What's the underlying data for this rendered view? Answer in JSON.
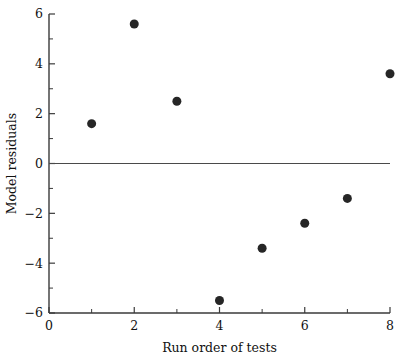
{
  "chart_data": {
    "type": "scatter",
    "title": "",
    "subtitle": "",
    "xlabel": "Run order of tests",
    "ylabel": "Model residuals",
    "xlim": [
      0,
      8
    ],
    "ylim": [
      -6,
      6
    ],
    "grid": false,
    "legend": null,
    "x": [
      1,
      2,
      3,
      4,
      5,
      6,
      7,
      8
    ],
    "values": [
      1.6,
      5.6,
      2.5,
      -5.5,
      -3.4,
      -2.4,
      -1.4,
      3.6
    ],
    "points": [
      {
        "x": 1,
        "y": 1.6
      },
      {
        "x": 2,
        "y": 5.6
      },
      {
        "x": 3,
        "y": 2.5
      },
      {
        "x": 4,
        "y": -5.5
      },
      {
        "x": 5,
        "y": -3.4
      },
      {
        "x": 6,
        "y": -2.4
      },
      {
        "x": 7,
        "y": -1.4
      },
      {
        "x": 8,
        "y": 3.6
      }
    ],
    "xticks": [
      0,
      2,
      4,
      6,
      8
    ],
    "xtick_labels": [
      "0",
      "2",
      "4",
      "6",
      "8"
    ],
    "x_minor_ticks": [
      1,
      3,
      5,
      7
    ],
    "yticks": [
      6,
      4,
      2,
      0,
      -2,
      -4,
      -6
    ],
    "ytick_labels": [
      "6",
      "4",
      "2",
      "0",
      "−2",
      "−4",
      "−6"
    ],
    "y_minor_ticks": [
      5,
      3,
      1,
      -1,
      -3,
      -5
    ],
    "reference_lines": [
      {
        "name": "zero-line",
        "orientation": "horizontal",
        "value": 0
      }
    ],
    "marker": {
      "shape": "circle",
      "color": "#262626",
      "size_px": 9
    },
    "colors": {
      "axis": "#3a3a3a",
      "reference_line": "#4a4a4a",
      "marker": "#262626",
      "background": "#ffffff",
      "text": "#111111"
    }
  },
  "axes": {
    "x_axis_label": "Run order of tests",
    "y_axis_label": "Model residuals"
  }
}
